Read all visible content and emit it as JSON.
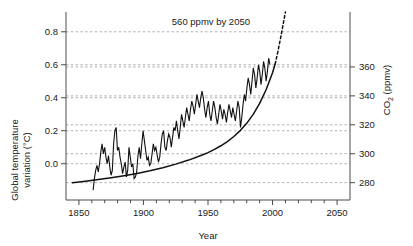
{
  "chart_data": {
    "type": "line",
    "title": "",
    "xlabel": "Year",
    "xlim": [
      1840,
      2060
    ],
    "x_ticks": [
      1850,
      1900,
      1950,
      2000,
      2050
    ],
    "x_tick_labels": [
      "1850",
      "1900",
      "1950",
      "2000",
      "2050"
    ],
    "x_minor_tick_step": 10,
    "grid": true,
    "grid_style": "dashed-horizontal",
    "legend": "none",
    "annotations": [
      {
        "text": "560 ppmv by 2050",
        "x": 1962,
        "y_axis": "co2"
      }
    ],
    "axes": [
      {
        "id": "co2",
        "side": "right",
        "ylabel_text": "CO",
        "ylabel_sub": "2",
        "ylabel_tail": " (ppmv)",
        "ylabel_full": "CO2 (ppmv)",
        "ticks": [
          280,
          300,
          320,
          340,
          360
        ],
        "tick_labels": [
          "280",
          "300",
          "320",
          "340",
          "360"
        ],
        "ylim": [
          268,
          398
        ]
      },
      {
        "id": "temperature",
        "side": "left",
        "ylabel_line1": "Global temperature",
        "ylabel_line2": "variation (°C)",
        "ylabel_full": "Global temperature variation (°C)",
        "ticks": [
          0.0,
          0.2,
          0.4,
          0.6,
          0.8
        ],
        "tick_labels": [
          "0.0",
          "0.2",
          "0.4",
          "0.6",
          "0.8"
        ],
        "ylim": [
          -0.22,
          0.92
        ]
      }
    ],
    "series": [
      {
        "name": "CO2 concentration (observed)",
        "axis": "co2",
        "style": "solid",
        "color": "#111111",
        "x": [
          1845,
          1855,
          1865,
          1875,
          1885,
          1895,
          1905,
          1915,
          1925,
          1935,
          1945,
          1950,
          1955,
          1960,
          1965,
          1970,
          1975,
          1980,
          1985,
          1990,
          1995,
          2000,
          2002
        ],
        "values": [
          280.0,
          281.0,
          282.1,
          283.4,
          284.8,
          286.4,
          288.2,
          290.3,
          292.8,
          295.6,
          298.9,
          300.8,
          303.0,
          305.5,
          308.4,
          311.9,
          316.0,
          321.0,
          327.2,
          334.8,
          344.2,
          356.0,
          362.0
        ]
      },
      {
        "name": "CO2 concentration (projected)",
        "axis": "co2",
        "style": "dashed",
        "color": "#111111",
        "x": [
          2002,
          2004,
          2006,
          2008,
          2010
        ],
        "values": [
          362.0,
          370.0,
          379.0,
          388.5,
          398.0
        ]
      },
      {
        "name": "Global temperature variation",
        "axis": "temperature",
        "style": "solid",
        "color": "#111111",
        "x_start": 1861,
        "x_end": 1998,
        "values": [
          -0.16,
          -0.09,
          -0.04,
          -0.01,
          -0.05,
          0.0,
          0.07,
          0.12,
          0.06,
          0.1,
          0.04,
          0.0,
          0.05,
          -0.02,
          -0.07,
          -0.04,
          0.12,
          0.2,
          0.22,
          0.08,
          0.1,
          0.04,
          0.0,
          -0.06,
          -0.02,
          0.01,
          -0.08,
          -0.04,
          0.1,
          0.04,
          -0.02,
          0.0,
          -0.09,
          -0.08,
          -0.05,
          0.05,
          0.1,
          0.03,
          0.12,
          0.2,
          0.14,
          0.08,
          0.02,
          0.04,
          -0.01,
          0.0,
          0.06,
          0.12,
          0.08,
          0.1,
          0.05,
          0.01,
          0.04,
          0.12,
          0.18,
          0.2,
          0.1,
          0.08,
          0.14,
          0.18,
          0.16,
          0.1,
          0.16,
          0.22,
          0.2,
          0.26,
          0.2,
          0.15,
          0.22,
          0.3,
          0.26,
          0.22,
          0.28,
          0.34,
          0.3,
          0.26,
          0.33,
          0.38,
          0.35,
          0.3,
          0.36,
          0.42,
          0.38,
          0.34,
          0.4,
          0.44,
          0.4,
          0.33,
          0.28,
          0.34,
          0.38,
          0.3,
          0.26,
          0.32,
          0.38,
          0.34,
          0.28,
          0.24,
          0.3,
          0.36,
          0.32,
          0.27,
          0.33,
          0.3,
          0.25,
          0.31,
          0.36,
          0.32,
          0.28,
          0.34,
          0.3,
          0.26,
          0.32,
          0.38,
          0.34,
          0.22,
          0.28,
          0.36,
          0.42,
          0.38,
          0.46,
          0.52,
          0.48,
          0.42,
          0.5,
          0.58,
          0.54,
          0.46,
          0.52,
          0.6,
          0.56,
          0.48,
          0.54,
          0.62,
          0.58,
          0.5,
          0.56,
          0.64,
          0.6
        ]
      }
    ]
  }
}
